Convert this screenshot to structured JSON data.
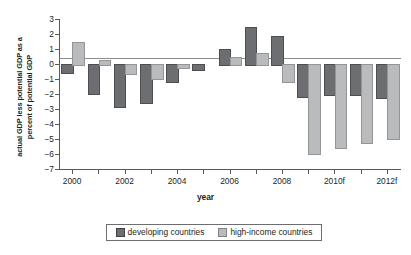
{
  "chart_data": {
    "type": "bar",
    "title": "",
    "xlabel": "year",
    "ylabel": "actual GDP less potential GDP as a percent of potential GDP",
    "ylabel_line1": "actual GDP less potential GDP as a",
    "ylabel_line2": "percent of potential GDP",
    "categories": [
      "2000",
      "2001",
      "2002",
      "2003",
      "2004",
      "2005",
      "2006",
      "2007",
      "2008",
      "2009",
      "2010f",
      "2011f",
      "2012f"
    ],
    "xtick_labels": [
      "2000",
      "2002",
      "2004",
      "2006",
      "2008",
      "2010f",
      "2012f"
    ],
    "ytick_labels": [
      "3",
      "2",
      "1",
      "0",
      "−1",
      "−2",
      "−3",
      "−4",
      "−5",
      "−6",
      "−7"
    ],
    "ytick_values": [
      3,
      2,
      1,
      0,
      -1,
      -2,
      -3,
      -4,
      -5,
      -6,
      -7
    ],
    "ylim": [
      -7,
      3
    ],
    "grid": false,
    "legend_position": "bottom",
    "series": [
      {
        "name": "developing countries",
        "color": "#6d6e71",
        "values": [
          -0.55,
          -1.9,
          -2.8,
          -2.55,
          -1.1,
          -0.3,
          1.0,
          2.5,
          1.9,
          -2.1,
          -2.0,
          -2.0,
          -2.2
        ]
      },
      {
        "name": "high-income countries",
        "color": "#b9bbbd",
        "values": [
          1.5,
          0.25,
          -0.6,
          -0.95,
          -0.2,
          0.0,
          0.45,
          0.75,
          -1.1,
          -5.9,
          -5.5,
          -5.2,
          -4.9
        ]
      }
    ]
  },
  "legend": {
    "items": [
      {
        "label": "developing countries",
        "swatch": "dev"
      },
      {
        "label": "high-income countries",
        "swatch": "high"
      }
    ]
  }
}
